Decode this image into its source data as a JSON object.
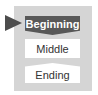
{
  "diagram": {
    "steps": [
      {
        "label": "Beginning",
        "state": "active"
      },
      {
        "label": "Middle",
        "state": "inactive"
      },
      {
        "label": "Ending",
        "state": "inactive"
      }
    ],
    "colors": {
      "panel": "#d5d5d5",
      "active_fill": "#585858",
      "pointer": "#4d4d4d",
      "inactive_fill": "#ffffff",
      "active_text": "#ffffff",
      "inactive_text": "#333333"
    }
  }
}
